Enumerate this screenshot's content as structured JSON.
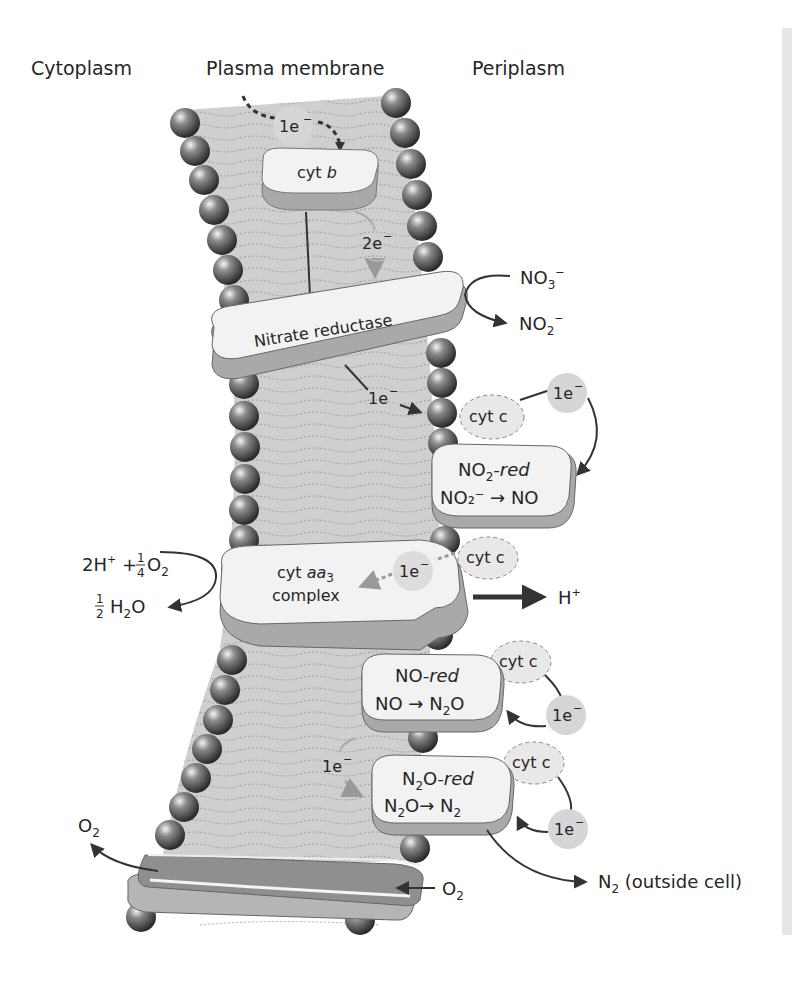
{
  "headers": {
    "cytoplasm": "Cytoplasm",
    "membrane": "Plasma membrane",
    "periplasm": "Periplasm"
  },
  "electrons": {
    "e1_top": "1e",
    "e2": "2e",
    "e1_nitrate": "1e",
    "e1_cytc_1": "1e",
    "e1_aa3": "1e",
    "e1_nored": "1e",
    "e1_inner": "1e",
    "e1_n2ored": "1e",
    "minus": "−"
  },
  "proteins": {
    "cyt_b": {
      "prefix": "cyt ",
      "italic": "b"
    },
    "nitrate_reductase": "Nitrate reductase",
    "cyt_c": "cyt c",
    "no2_red": {
      "title_pre": "NO",
      "title_sub": "2",
      "title_italic": "-red",
      "reaction": "NO₂⁻ → NO"
    },
    "cyt_aa3": {
      "line1_pre": "cyt ",
      "line1_italic": "aa",
      "line1_sub": "3",
      "line2": "complex"
    },
    "no_red": {
      "title_pre": "NO",
      "title_italic": "-red",
      "reaction_pre": "NO → N",
      "reaction_sub": "2",
      "reaction_post": "O"
    },
    "n2o_red": {
      "title_pre": "N",
      "title_sub": "2",
      "title_mid": "O",
      "title_italic": "-red",
      "reaction_a": "N",
      "reaction_a_sub": "2",
      "reaction_b": "O→ N",
      "reaction_b_sub": "2"
    }
  },
  "reactions": {
    "no3": {
      "base": "NO",
      "sub": "3",
      "sup": "−"
    },
    "no2": {
      "base": "NO",
      "sub": "2",
      "sup": "−"
    },
    "proton_in": {
      "text": "2H",
      "sup": "+",
      "plus": " + ",
      "frac_num": "1",
      "frac_den": "4",
      "o2": "O",
      "o2_sub": "2"
    },
    "water": {
      "frac_num": "1",
      "frac_den": "2",
      "h": "H",
      "h_sub": "2",
      "o": "O"
    },
    "proton_out": {
      "text": "H",
      "sup": "+"
    },
    "n2_out": {
      "base": "N",
      "sub": "2",
      "suffix": " (outside cell)"
    },
    "o2_left": {
      "base": "O",
      "sub": "2"
    },
    "o2_right": {
      "base": "O",
      "sub": "2"
    }
  },
  "colors": {
    "membrane_fill": "#cfcfcf",
    "protein_fill": "#f2f2f2",
    "protein_shadow": "#a9a9a9",
    "electron_fill": "#d6d6d6",
    "bead_dark": "#3a3a3a",
    "arrow": "#333333",
    "side_strip": "#e6e6e6"
  }
}
